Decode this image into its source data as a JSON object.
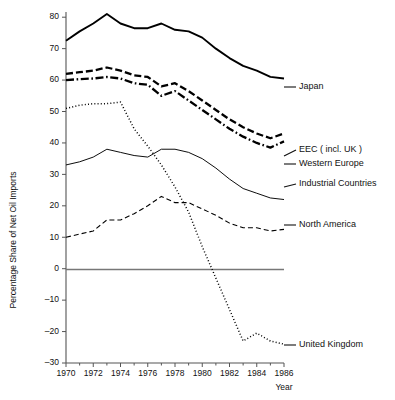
{
  "chart_data": {
    "type": "line",
    "title": "",
    "xlabel": "Year",
    "ylabel": "Percentage Share of Net Oil Imports",
    "xlim": [
      1970,
      1986
    ],
    "ylim": [
      -30,
      80
    ],
    "grid": false,
    "legend_position": "right-inline-labels",
    "x": [
      1970,
      1971,
      1972,
      1973,
      1974,
      1975,
      1976,
      1977,
      1978,
      1979,
      1980,
      1981,
      1982,
      1983,
      1984,
      1985,
      1986
    ],
    "xticks": [
      1970,
      1972,
      1974,
      1976,
      1978,
      1980,
      1982,
      1984,
      1986
    ],
    "xticks_minor": [
      1971,
      1973,
      1975,
      1977,
      1979,
      1981,
      1983,
      1985
    ],
    "yticks": [
      -30,
      -20,
      -10,
      0,
      10,
      20,
      30,
      40,
      50,
      60,
      70,
      80
    ],
    "ytick_labels": [
      "–30",
      "–20",
      "–10",
      "0",
      "10",
      "20",
      "30",
      "40",
      "50",
      "60",
      "70",
      "80"
    ],
    "series": [
      {
        "name": "Japan",
        "label": "Japan",
        "style": "solid-thick",
        "values": [
          72.5,
          75.5,
          78.0,
          81.0,
          78.0,
          76.5,
          76.5,
          78.0,
          76.0,
          75.5,
          73.5,
          70.0,
          67.0,
          64.5,
          63.0,
          61.0,
          60.5
        ]
      },
      {
        "name": "EEC (incl. UK)",
        "label": "EEC ( incl. UK )",
        "style": "dashed-thick",
        "values": [
          62.0,
          62.5,
          63.0,
          64.0,
          63.0,
          61.5,
          61.0,
          58.0,
          59.0,
          56.5,
          53.5,
          50.5,
          47.5,
          45.0,
          43.0,
          41.5,
          43.0
        ]
      },
      {
        "name": "Western Europe",
        "label": "Western Europe",
        "style": "dashdot-thick",
        "values": [
          60.0,
          60.3,
          60.5,
          61.0,
          60.5,
          59.0,
          58.5,
          55.0,
          56.5,
          53.5,
          50.5,
          47.5,
          44.5,
          42.0,
          40.0,
          38.5,
          40.5
        ]
      },
      {
        "name": "United Kingdom",
        "label": "United Kingdom",
        "style": "dotted",
        "values": [
          51.0,
          52.0,
          52.5,
          52.5,
          53.0,
          44.5,
          39.0,
          33.0,
          26.0,
          18.0,
          7.0,
          -3.0,
          -13.0,
          -23.0,
          -20.5,
          -23.0,
          -24.0
        ]
      },
      {
        "name": "Industrial Countries",
        "label": "Industrial Countries",
        "style": "solid-thin",
        "values": [
          33.0,
          34.0,
          35.5,
          38.0,
          37.0,
          36.0,
          35.5,
          38.0,
          38.0,
          37.0,
          35.0,
          32.0,
          28.5,
          25.5,
          24.0,
          22.5,
          22.0
        ]
      },
      {
        "name": "North America",
        "label": "North America",
        "style": "dashed-thin",
        "values": [
          10.0,
          11.0,
          12.0,
          15.5,
          15.5,
          17.5,
          20.0,
          23.0,
          21.0,
          21.0,
          19.0,
          17.0,
          14.5,
          13.0,
          13.0,
          12.0,
          12.5
        ]
      }
    ]
  },
  "labels": {
    "japan": "Japan",
    "eec": "EEC ( incl. UK )",
    "western_europe": "Western Europe",
    "industrial_countries": "Industrial Countries",
    "north_america": "North America",
    "united_kingdom": "United Kingdom",
    "x_axis_title": "Year",
    "y_axis_title": "Percentage Share of Net Oil Imports"
  },
  "colors": {
    "ink": "#000000",
    "axis": "#555555",
    "zero_line": "#777777",
    "background": "#ffffff"
  }
}
